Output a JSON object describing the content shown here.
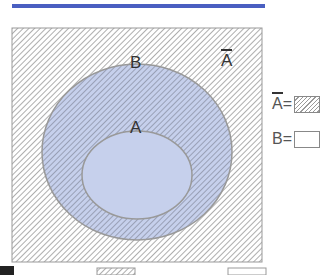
{
  "header": {
    "accent_color": "#4a5fc1"
  },
  "diagram": {
    "universe_label": "A",
    "universe_label_overline": true,
    "set_b_label": "B",
    "set_a_label": "A",
    "inner_fill_color": "#c6d0ec",
    "hatch_color": "#9a9a9a"
  },
  "legend": {
    "items": [
      {
        "symbol": "A",
        "overline": true,
        "equals": "=",
        "swatch": "hatched"
      },
      {
        "symbol": "B",
        "overline": false,
        "equals": "=",
        "swatch": "blank"
      }
    ]
  }
}
